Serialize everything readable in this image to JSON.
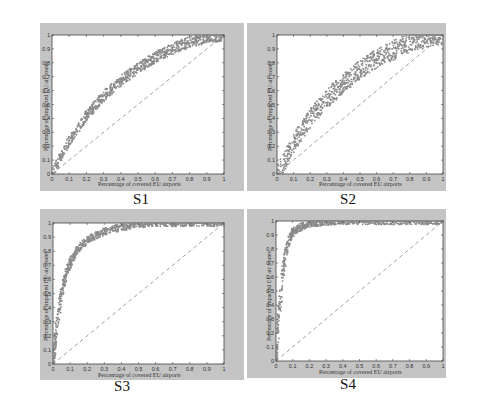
{
  "figure": {
    "panels": [
      {
        "id": "S1",
        "label": "S1"
      },
      {
        "id": "S2",
        "label": "S2"
      },
      {
        "id": "S3",
        "label": "S3"
      },
      {
        "id": "S4",
        "label": "S4"
      }
    ],
    "axes": {
      "xlabel": "Percentage of covered EU airports",
      "ylabel": "Percentage of impacted EU air routes",
      "xticks": [
        "0",
        "0.1",
        "0.2",
        "0.3",
        "0.4",
        "0.5",
        "0.6",
        "0.7",
        "0.8",
        "0.9",
        "1"
      ],
      "yticks": [
        "0",
        "0.1",
        "0.2",
        "0.3",
        "0.4",
        "0.5",
        "0.6",
        "0.7",
        "0.8",
        "0.9",
        "1"
      ]
    },
    "colors": {
      "panel_bg": "#c4c4c4",
      "plot_bg": "#ffffff",
      "scatter": "#8a8a8a",
      "diagonal": "#8a8a8a"
    }
  },
  "chart_data": [
    {
      "type": "scatter",
      "title": "S1",
      "xlabel": "Percentage of covered EU airports",
      "ylabel": "Percentage of impacted EU air routes",
      "xlim": [
        0,
        1
      ],
      "ylim": [
        0,
        1
      ],
      "grid": false,
      "reference_line": {
        "style": "dashed",
        "from": [
          0,
          0
        ],
        "to": [
          1,
          1
        ]
      },
      "series": [
        {
          "name": "scatter band (median)",
          "x": [
            0,
            0.05,
            0.1,
            0.2,
            0.3,
            0.4,
            0.5,
            0.6,
            0.7,
            0.8,
            0.9,
            1
          ],
          "y": [
            0,
            0.12,
            0.24,
            0.42,
            0.56,
            0.67,
            0.76,
            0.84,
            0.9,
            0.95,
            0.98,
            1
          ],
          "band_halfwidth": 0.04
        }
      ]
    },
    {
      "type": "scatter",
      "title": "S2",
      "xlabel": "Percentage of covered EU airports",
      "ylabel": "Percentage of impacted EU air routes",
      "xlim": [
        0,
        1
      ],
      "ylim": [
        0,
        1
      ],
      "grid": false,
      "reference_line": {
        "style": "dashed",
        "from": [
          0,
          0
        ],
        "to": [
          1,
          1
        ]
      },
      "series": [
        {
          "name": "scatter band (median)",
          "x": [
            0,
            0.05,
            0.1,
            0.2,
            0.3,
            0.4,
            0.5,
            0.6,
            0.7,
            0.8,
            0.9,
            1
          ],
          "y": [
            0,
            0.1,
            0.22,
            0.4,
            0.54,
            0.65,
            0.75,
            0.83,
            0.89,
            0.94,
            0.98,
            1
          ],
          "band_halfwidth": 0.07
        }
      ]
    },
    {
      "type": "scatter",
      "title": "S3",
      "xlabel": "Percentage of covered EU airports",
      "ylabel": "Percentage of impacted EU air routes",
      "xlim": [
        0,
        1
      ],
      "ylim": [
        0,
        1
      ],
      "grid": false,
      "reference_line": {
        "style": "dashed",
        "from": [
          0,
          0
        ],
        "to": [
          1,
          1
        ]
      },
      "series": [
        {
          "name": "scatter band (median)",
          "x": [
            0,
            0.01,
            0.03,
            0.05,
            0.08,
            0.1,
            0.15,
            0.2,
            0.3,
            0.4,
            0.5,
            0.6,
            0.7,
            1
          ],
          "y": [
            0,
            0.15,
            0.35,
            0.5,
            0.65,
            0.72,
            0.82,
            0.88,
            0.94,
            0.97,
            0.99,
            1,
            1,
            1
          ],
          "band_halfwidth": 0.025
        }
      ]
    },
    {
      "type": "scatter",
      "title": "S4",
      "xlabel": "Percentage of covered EU airports",
      "ylabel": "Percentage of impacted EU air routes",
      "xlim": [
        0,
        1
      ],
      "ylim": [
        0,
        1
      ],
      "grid": false,
      "reference_line": {
        "style": "dashed",
        "from": [
          0,
          0
        ],
        "to": [
          1,
          1
        ]
      },
      "series": [
        {
          "name": "scatter band (median)",
          "x": [
            0,
            0.01,
            0.02,
            0.04,
            0.06,
            0.08,
            0.1,
            0.15,
            0.2,
            0.3,
            0.4,
            1
          ],
          "y": [
            0,
            0.2,
            0.35,
            0.6,
            0.78,
            0.87,
            0.92,
            0.96,
            0.98,
            0.995,
            1,
            1
          ],
          "band_halfwidth": 0.025
        }
      ]
    }
  ]
}
